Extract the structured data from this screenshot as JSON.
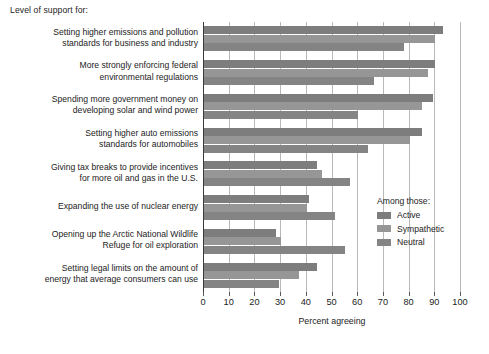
{
  "intro_text": "Level of support for:",
  "legend": {
    "title": "Among those:",
    "entries": [
      {
        "label": "Active",
        "color": "#7d7d7d"
      },
      {
        "label": "Sympathetic",
        "color": "#969696"
      },
      {
        "label": "Neutral",
        "color": "#848484"
      }
    ]
  },
  "chart_data": {
    "type": "bar",
    "orientation": "horizontal",
    "title": "Level of support for:",
    "xlabel": "Percent agreeing",
    "ylabel": "",
    "xlim": [
      0,
      100
    ],
    "xticks": [
      0,
      10,
      20,
      30,
      40,
      50,
      60,
      70,
      80,
      90,
      100
    ],
    "grid": true,
    "legend_position": "right",
    "legend_title": "Among those:",
    "categories": [
      "Setting higher emissions and pollution standards for business and industry",
      "More strongly enforcing federal environmental regulations",
      "Spending more government money on developing solar and wind power",
      "Setting higher auto emissions standards for automobiles",
      "Giving tax breaks to provide incentives for more oil and gas in the U.S.",
      "Expanding the use of nuclear energy",
      "Opening up the Arctic National Wildlife Refuge for oil exploration",
      "Setting legal limits on the amount of energy that average consumers can use"
    ],
    "category_lines": [
      [
        "Setting higher emissions and pollution",
        "standards for business and industry"
      ],
      [
        "More strongly enforcing federal",
        "environmental regulations"
      ],
      [
        "Spending more government money on",
        "developing solar and wind power"
      ],
      [
        "Setting higher auto emissions",
        "standards for automobiles"
      ],
      [
        "Giving tax breaks to provide incentives",
        "for more oil and gas in the U.S."
      ],
      [
        "Expanding the use of nuclear energy"
      ],
      [
        "Opening up the Arctic National Wildlife",
        "Refuge for oil exploration"
      ],
      [
        "Setting legal limits on the amount of",
        "energy that average consumers can use"
      ]
    ],
    "series": [
      {
        "name": "Active",
        "color": "#7d7d7d",
        "values": [
          93,
          90,
          89,
          85,
          44,
          41,
          28,
          44
        ]
      },
      {
        "name": "Sympathetic",
        "color": "#969696",
        "values": [
          90,
          87,
          85,
          80,
          46,
          40,
          30,
          37
        ]
      },
      {
        "name": "Neutral",
        "color": "#848484",
        "values": [
          78,
          66,
          60,
          64,
          57,
          51,
          55,
          29
        ]
      }
    ]
  }
}
